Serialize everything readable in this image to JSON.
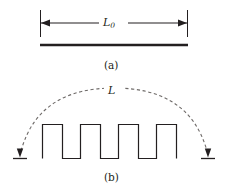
{
  "figure": {
    "line_color": "#231f20",
    "dash_color": "#6e6a68",
    "background": "#ffffff"
  },
  "panel_a": {
    "caption": "(a)",
    "dimension_label": "L",
    "dimension_subscript": "0",
    "dimension_line": {
      "x_start": 40,
      "x_end": 188,
      "y": 23,
      "arrow_left": "left-arrowhead",
      "arrow_right": "right-arrowhead"
    },
    "extension_ticks": {
      "y_top": 10,
      "y_bottom": 36
    },
    "rod": {
      "x_start": 40,
      "x_end": 188,
      "y": 45,
      "thickness": 2.4
    }
  },
  "panel_b": {
    "caption": "(b)",
    "span_label": "L",
    "square_wave": {
      "baseline_y": 158,
      "top_y": 124,
      "x_start": 42,
      "x_end": 186,
      "teeth": 4,
      "vertices_x": [
        42,
        42,
        62,
        62,
        80,
        80,
        100,
        100,
        118,
        118,
        138,
        138,
        156,
        156,
        176,
        176,
        186,
        186
      ],
      "stroke_width": 1.1
    },
    "arc": {
      "left_x": 20,
      "right_x": 208,
      "apex_y": 90,
      "end_y": 152,
      "dash_pattern": "3.2 2.6",
      "stroke_width": 1.1
    },
    "ground_marks": [
      {
        "x": 20,
        "y": 158,
        "half_width": 7
      },
      {
        "x": 208,
        "y": 158,
        "half_width": 7
      }
    ],
    "arrowheads": [
      {
        "name": "left-down-arrowhead",
        "x": 20,
        "y": 156
      },
      {
        "name": "right-down-arrowhead",
        "x": 208,
        "y": 156
      }
    ]
  }
}
